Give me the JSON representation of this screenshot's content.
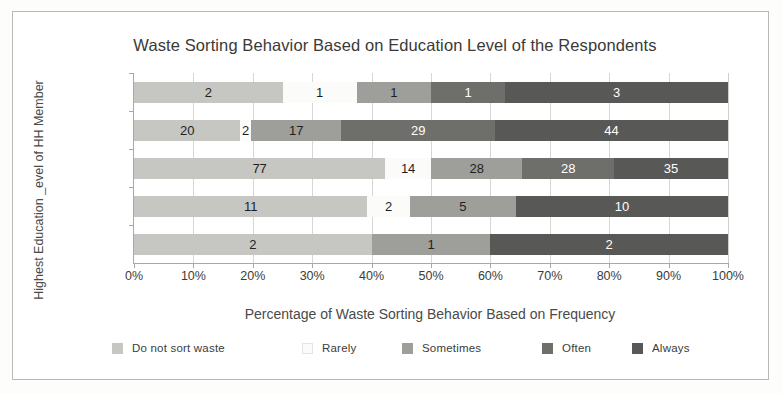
{
  "chart_data": {
    "type": "bar",
    "orientation": "horizontal",
    "stacked": true,
    "normalized": true,
    "title": "Waste Sorting Behavior Based on Education Level of the Respondents",
    "xlabel": "Percentage of Waste Sorting Behavior Based on Frequency",
    "ylabel": "Highest Education _evel of HH Member",
    "categories": [
      "SD",
      "SMP",
      "SMA",
      "D3/S1",
      "S2/S3"
    ],
    "category_order_top_to_bottom": [
      "S2/S3",
      "D3/S1",
      "SMA",
      "SMP",
      "SD"
    ],
    "xlim": [
      0,
      100
    ],
    "xticks": [
      0,
      10,
      20,
      30,
      40,
      50,
      60,
      70,
      80,
      90,
      100
    ],
    "xtick_labels": [
      "0%",
      "10%",
      "20%",
      "30%",
      "40%",
      "50%",
      "60%",
      "70%",
      "80%",
      "90%",
      "100%"
    ],
    "grid": true,
    "legend_position": "bottom",
    "series": [
      {
        "name": "Do not sort waste",
        "color": "#c6c6c2",
        "label_color": "dark",
        "values": [
          2,
          11,
          77,
          20,
          2
        ]
      },
      {
        "name": "Rarely",
        "color": "#fbfbfa",
        "label_color": "dark",
        "values": [
          0,
          2,
          14,
          2,
          1
        ]
      },
      {
        "name": "Sometimes",
        "color": "#9e9e9a",
        "label_color": "dark",
        "values": [
          1,
          5,
          28,
          17,
          1
        ]
      },
      {
        "name": "Often",
        "color": "#6e6e6b",
        "label_color": "light",
        "values": [
          0,
          0,
          28,
          29,
          1
        ]
      },
      {
        "name": "Always",
        "color": "#585856",
        "label_color": "light",
        "values": [
          2,
          10,
          35,
          44,
          3
        ]
      }
    ],
    "rows": [
      {
        "category": "S2/S3",
        "total": 8,
        "segments": [
          {
            "series": "Do not sort waste",
            "value": 2,
            "percent": 25.0
          },
          {
            "series": "Rarely",
            "value": 1,
            "percent": 12.5
          },
          {
            "series": "Sometimes",
            "value": 1,
            "percent": 12.5
          },
          {
            "series": "Often",
            "value": 1,
            "percent": 12.5
          },
          {
            "series": "Always",
            "value": 3,
            "percent": 37.5
          }
        ]
      },
      {
        "category": "D3/S1",
        "total": 112,
        "segments": [
          {
            "series": "Do not sort waste",
            "value": 20,
            "percent": 17.9
          },
          {
            "series": "Rarely",
            "value": 2,
            "percent": 1.8
          },
          {
            "series": "Sometimes",
            "value": 17,
            "percent": 15.2
          },
          {
            "series": "Often",
            "value": 29,
            "percent": 25.9
          },
          {
            "series": "Always",
            "value": 44,
            "percent": 39.2
          }
        ]
      },
      {
        "category": "SMA",
        "total": 182,
        "segments": [
          {
            "series": "Do not sort waste",
            "value": 77,
            "percent": 42.3
          },
          {
            "series": "Rarely",
            "value": 14,
            "percent": 7.7
          },
          {
            "series": "Sometimes",
            "value": 28,
            "percent": 15.4
          },
          {
            "series": "Often",
            "value": 28,
            "percent": 15.4
          },
          {
            "series": "Always",
            "value": 35,
            "percent": 19.2
          }
        ]
      },
      {
        "category": "SMP",
        "total": 28,
        "segments": [
          {
            "series": "Do not sort waste",
            "value": 11,
            "percent": 39.3
          },
          {
            "series": "Rarely",
            "value": 2,
            "percent": 7.1
          },
          {
            "series": "Sometimes",
            "value": 5,
            "percent": 17.9
          },
          {
            "series": "Always",
            "value": 10,
            "percent": 35.7
          }
        ]
      },
      {
        "category": "SD",
        "total": 5,
        "segments": [
          {
            "series": "Do not sort waste",
            "value": 2,
            "percent": 40.0
          },
          {
            "series": "Sometimes",
            "value": 1,
            "percent": 20.0
          },
          {
            "series": "Always",
            "value": 2,
            "percent": 40.0
          }
        ]
      }
    ]
  }
}
